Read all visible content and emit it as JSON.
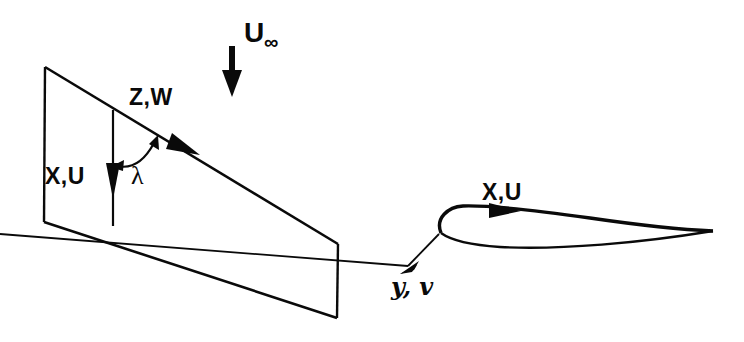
{
  "figure": {
    "background_color": "#ffffff",
    "ink_color": "#0a0a0a"
  },
  "freestream": {
    "label": "U",
    "subscript": "∞",
    "arrow_name": "freestream-velocity-arrow",
    "arrow_direction": "down"
  },
  "wing_planform": {
    "name": "swept-wing-planform",
    "labels": {
      "spanwise": "Z,W",
      "chordwise": "X,U",
      "sweep_angle": "λ"
    },
    "sweep_angle_symbol": "λ",
    "arrows": {
      "spanwise_arrow": "leading-edge-direction-arrow",
      "chordwise_arrow": "chordwise-direction-arrow",
      "angle_arc": "sweep-angle-arc"
    }
  },
  "airfoil_section": {
    "name": "airfoil-section",
    "labels": {
      "chordwise": "X,U",
      "normal": "y, v"
    },
    "arrows": {
      "chordwise_arrow": "airfoil-chordwise-arrow",
      "normal_arrow": "airfoil-normal-arrow"
    }
  }
}
